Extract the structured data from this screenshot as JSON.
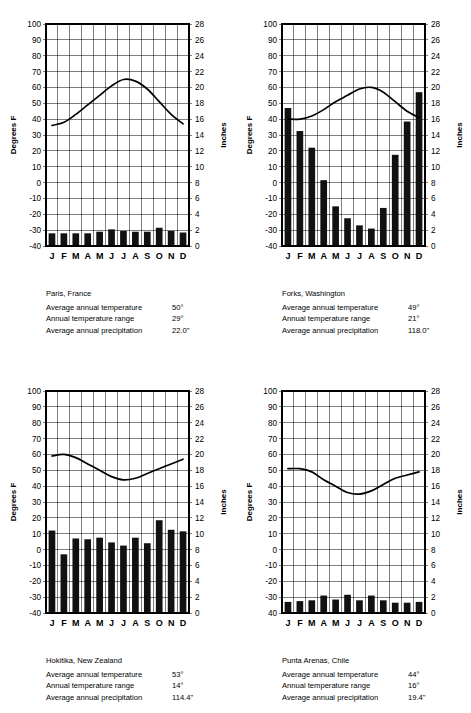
{
  "axes": {
    "left_title": "Degrees F",
    "right_title": "Inches",
    "temp_ticks": [
      100,
      90,
      80,
      70,
      60,
      50,
      40,
      30,
      20,
      10,
      0,
      -10,
      -20,
      -30,
      -40
    ],
    "precip_ticks": [
      28,
      26,
      24,
      22,
      20,
      18,
      16,
      14,
      12,
      10,
      8,
      6,
      4,
      2,
      0
    ],
    "months": [
      "J",
      "F",
      "M",
      "A",
      "M",
      "J",
      "J",
      "A",
      "S",
      "O",
      "N",
      "D"
    ],
    "temp_min": -40,
    "temp_max": 100,
    "precip_min": 0,
    "precip_max": 28
  },
  "labels": {
    "avg_temp": "Average annual temperature",
    "temp_range": "Annual temperature range",
    "avg_precip": "Average annual precipitation"
  },
  "colors": {
    "bar": "#111111",
    "line": "#000000",
    "grid": "#000000",
    "background": "#ffffff"
  },
  "chart_data": [
    {
      "id": "paris",
      "type": "bar",
      "title": "Paris, France",
      "xlabel": "",
      "ylabel": "Degrees F",
      "y2label": "Inches",
      "ylim": [
        -40,
        100
      ],
      "y2lim": [
        0,
        28
      ],
      "grid": true,
      "legend": "none",
      "categories": [
        "J",
        "F",
        "M",
        "A",
        "M",
        "J",
        "J",
        "A",
        "S",
        "O",
        "N",
        "D"
      ],
      "series": [
        {
          "name": "Precipitation (inches)",
          "kind": "bar",
          "axis": "right",
          "values": [
            1.6,
            1.6,
            1.6,
            1.6,
            1.8,
            2.1,
            1.9,
            1.8,
            1.8,
            2.3,
            1.9,
            1.7
          ]
        },
        {
          "name": "Temperature (°F)",
          "kind": "line",
          "axis": "left",
          "values": [
            36,
            38,
            43,
            49,
            55,
            61,
            65,
            64,
            59,
            51,
            43,
            37
          ]
        }
      ],
      "stats": {
        "avg_temp": "50°",
        "temp_range": "29°",
        "avg_precip": "22.0\""
      }
    },
    {
      "id": "forks",
      "type": "bar",
      "title": "Forks, Washington",
      "xlabel": "",
      "ylabel": "Degrees F",
      "y2label": "Inches",
      "ylim": [
        -40,
        100
      ],
      "y2lim": [
        0,
        28
      ],
      "grid": true,
      "legend": "none",
      "categories": [
        "J",
        "F",
        "M",
        "A",
        "M",
        "J",
        "J",
        "A",
        "S",
        "O",
        "N",
        "D"
      ],
      "series": [
        {
          "name": "Precipitation (inches)",
          "kind": "bar",
          "axis": "right",
          "values": [
            17.4,
            14.5,
            12.4,
            8.3,
            5.0,
            3.5,
            2.6,
            2.2,
            4.8,
            11.5,
            15.7,
            19.4
          ]
        },
        {
          "name": "Temperature (°F)",
          "kind": "line",
          "axis": "left",
          "values": [
            40,
            40,
            42,
            46,
            51,
            55,
            59,
            60,
            57,
            51,
            45,
            41
          ]
        }
      ],
      "stats": {
        "avg_temp": "49°",
        "temp_range": "21°",
        "avg_precip": "118.0\""
      }
    },
    {
      "id": "hokitika",
      "type": "bar",
      "title": "Hokitika, New Zealand",
      "xlabel": "",
      "ylabel": "Degrees F",
      "y2label": "Inches",
      "ylim": [
        -40,
        100
      ],
      "y2lim": [
        0,
        28
      ],
      "grid": true,
      "legend": "none",
      "categories": [
        "J",
        "F",
        "M",
        "A",
        "M",
        "J",
        "J",
        "A",
        "S",
        "O",
        "N",
        "D"
      ],
      "series": [
        {
          "name": "Precipitation (inches)",
          "kind": "bar",
          "axis": "right",
          "values": [
            10.4,
            7.4,
            9.4,
            9.3,
            9.5,
            8.9,
            8.5,
            9.5,
            8.8,
            11.7,
            10.5,
            10.3
          ]
        },
        {
          "name": "Temperature (°F)",
          "kind": "line",
          "axis": "left",
          "values": [
            59,
            60,
            58,
            54,
            50,
            46,
            44,
            45,
            48,
            51,
            54,
            57
          ]
        }
      ],
      "stats": {
        "avg_temp": "53°",
        "temp_range": "14°",
        "avg_precip": "114.4\""
      }
    },
    {
      "id": "punta-arenas",
      "type": "bar",
      "title": "Punta Arenas, Chile",
      "xlabel": "",
      "ylabel": "Degrees F",
      "y2label": "Inches",
      "ylim": [
        -40,
        100
      ],
      "y2lim": [
        0,
        28
      ],
      "grid": true,
      "legend": "none",
      "bottom_tick_override": "40",
      "categories": [
        "J",
        "F",
        "M",
        "A",
        "M",
        "J",
        "J",
        "A",
        "S",
        "O",
        "N",
        "D"
      ],
      "series": [
        {
          "name": "Precipitation (inches)",
          "kind": "bar",
          "axis": "right",
          "values": [
            1.4,
            1.5,
            1.6,
            2.2,
            1.7,
            2.3,
            1.6,
            2.2,
            1.6,
            1.3,
            1.3,
            1.4
          ]
        },
        {
          "name": "Temperature (°F)",
          "kind": "line",
          "axis": "left",
          "values": [
            51,
            51,
            49,
            44,
            40,
            36,
            35,
            37,
            41,
            45,
            47,
            49
          ]
        }
      ],
      "stats": {
        "avg_temp": "44°",
        "temp_range": "16°",
        "avg_precip": "19.4\""
      }
    }
  ]
}
